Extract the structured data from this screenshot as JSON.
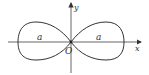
{
  "diagram": {
    "type": "lemniscate-curve",
    "axes": {
      "x_label": "x",
      "y_label": "y",
      "origin_label": "O"
    },
    "loops": [
      {
        "side": "left",
        "label": "a"
      },
      {
        "side": "right",
        "label": "a"
      }
    ],
    "colors": {
      "stroke": "#333333",
      "axis": "#555555",
      "background": "#ffffff"
    }
  }
}
